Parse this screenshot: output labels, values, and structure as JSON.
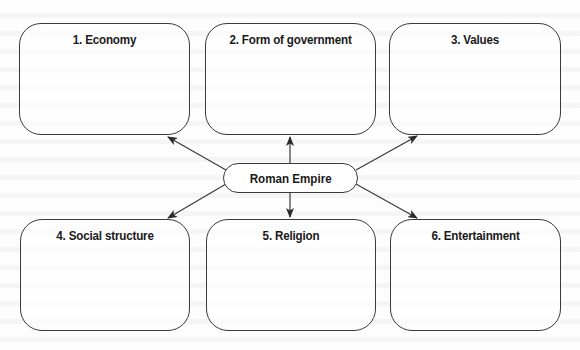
{
  "diagram": {
    "type": "hub-and-spoke concept map",
    "center": {
      "label": "Roman Empire"
    },
    "boxes": [
      {
        "number": 1,
        "label": "1. Economy"
      },
      {
        "number": 2,
        "label": "2. Form of government"
      },
      {
        "number": 3,
        "label": "3. Values"
      },
      {
        "number": 4,
        "label": "4. Social structure"
      },
      {
        "number": 5,
        "label": "5. Religion"
      },
      {
        "number": 6,
        "label": "6. Entertainment"
      }
    ],
    "edges": [
      {
        "from": "Roman Empire",
        "to": "1. Economy",
        "direction": "arrow-to-box"
      },
      {
        "from": "Roman Empire",
        "to": "2. Form of government",
        "direction": "arrow-to-box"
      },
      {
        "from": "Roman Empire",
        "to": "3. Values",
        "direction": "arrow-to-box"
      },
      {
        "from": "Roman Empire",
        "to": "4. Social structure",
        "direction": "arrow-to-box"
      },
      {
        "from": "Roman Empire",
        "to": "5. Religion",
        "direction": "arrow-to-box"
      },
      {
        "from": "Roman Empire",
        "to": "6. Entertainment",
        "direction": "arrow-to-box"
      }
    ]
  },
  "colors": {
    "stroke": "#3a3a3a",
    "text": "#1a1a1a",
    "background": "#fdfdfd"
  }
}
